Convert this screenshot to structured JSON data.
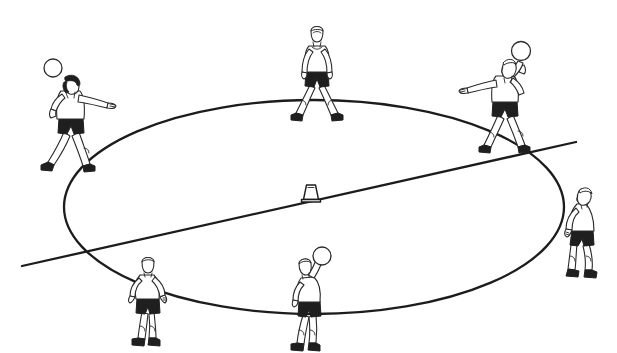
{
  "figure": {
    "title": "Circle passing drill diagram",
    "background_color": "#ffffff",
    "ink_color": "#1c1c1c",
    "shorts_color": "#1f1f1f",
    "ball_color": "#ffffff",
    "style": "black and white line art"
  },
  "court": {
    "ellipse": {
      "name": "circle marking",
      "cx": 314,
      "cy": 207,
      "rx": 250,
      "ry": 107
    },
    "diagonal_line": {
      "name": "straight line through circle",
      "x1": 22,
      "y1": 266,
      "x2": 576,
      "y2": 142
    },
    "cone": {
      "name": "centre cone marker",
      "x": 311,
      "y": 196,
      "label": ""
    }
  },
  "players": [
    {
      "id": "player-left",
      "position": "outside circle, left",
      "facing": "right",
      "hair": "dark",
      "has_ball": true,
      "ball_hand": "left",
      "pose": "ball held at head height, other arm extended forward",
      "x": 70,
      "y": 100
    },
    {
      "id": "player-top-center",
      "position": "outside circle, top centre",
      "facing": "front",
      "hair": "light",
      "has_ball": false,
      "ball_hand": "",
      "pose": "standing, feet wide, arms down ready",
      "x": 317,
      "y": 55
    },
    {
      "id": "player-top-right",
      "position": "outside circle, top right",
      "facing": "left",
      "hair": "light",
      "has_ball": true,
      "ball_hand": "right",
      "pose": "ball held at head height, other arm extended forward",
      "x": 505,
      "y": 85
    },
    {
      "id": "player-right",
      "position": "outside circle, right",
      "facing": "left",
      "hair": "light",
      "has_ball": false,
      "ball_hand": "",
      "pose": "bent forward, hands at waist, ready to receive",
      "x": 583,
      "y": 220
    },
    {
      "id": "player-bottom-left",
      "position": "on circle line, bottom left",
      "facing": "away",
      "hair": "light",
      "has_ball": false,
      "ball_hand": "",
      "pose": "seen from behind, arms slightly out",
      "x": 148,
      "y": 290
    },
    {
      "id": "player-bottom-center",
      "position": "on circle line, bottom centre",
      "facing": "away",
      "hair": "light",
      "has_ball": true,
      "ball_hand": "right",
      "pose": "seen from behind, ball raised overhead",
      "x": 310,
      "y": 295
    }
  ],
  "balls": [
    {
      "id": "ball-left-player",
      "cx": 53,
      "cy": 68,
      "r": 9
    },
    {
      "id": "ball-top-right-player",
      "cx": 521,
      "cy": 51,
      "r": 9.5
    },
    {
      "id": "ball-bottom-center-player",
      "cx": 322,
      "cy": 256,
      "r": 9
    }
  ]
}
